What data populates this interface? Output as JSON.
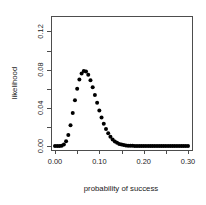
{
  "chart_data": {
    "type": "scatter",
    "title": "",
    "xlabel": "probability of success",
    "ylabel": "likelihood",
    "xlim": [
      0.0,
      0.3
    ],
    "ylim": [
      0.0,
      0.132
    ],
    "grid": false,
    "legend": null,
    "point_style": {
      "marker": "filled-circle",
      "color": "#000000",
      "size_px": 2.0
    },
    "xticks": [
      0.0,
      0.1,
      0.2,
      0.3
    ],
    "xtick_labels": [
      "0.00",
      "0.10",
      "0.20",
      "0.30"
    ],
    "x_minor_ticks": [
      0.05,
      0.15,
      0.25
    ],
    "yticks": [
      0.0,
      0.04,
      0.08,
      0.12
    ],
    "ytick_labels": [
      "0.00",
      "0.04",
      "0.08",
      "0.12"
    ],
    "y_minor_ticks": [
      0.02,
      0.06,
      0.1
    ],
    "x": [
      0.0,
      0.005,
      0.01,
      0.015,
      0.02,
      0.025,
      0.03,
      0.035,
      0.04,
      0.045,
      0.05,
      0.055,
      0.06,
      0.065,
      0.07,
      0.075,
      0.08,
      0.085,
      0.09,
      0.095,
      0.1,
      0.105,
      0.11,
      0.115,
      0.12,
      0.125,
      0.13,
      0.135,
      0.14,
      0.145,
      0.15,
      0.155,
      0.16,
      0.165,
      0.17,
      0.175,
      0.18,
      0.185,
      0.19,
      0.195,
      0.2,
      0.205,
      0.21,
      0.215,
      0.22,
      0.225,
      0.23,
      0.235,
      0.24,
      0.245,
      0.25,
      0.255,
      0.26,
      0.265,
      0.27,
      0.275,
      0.28,
      0.285,
      0.29,
      0.295,
      0.3
    ],
    "y": [
      0.0,
      0.0,
      2e-05,
      0.00026,
      0.00146,
      0.00486,
      0.01158,
      0.02182,
      0.03452,
      0.04786,
      0.06002,
      0.0696,
      0.07586,
      0.07861,
      0.07802,
      0.07455,
      0.06885,
      0.06161,
      0.05353,
      0.04522,
      0.03719,
      0.0298,
      0.02328,
      0.01775,
      0.01323,
      0.00965,
      0.00689,
      0.00481,
      0.0033,
      0.00222,
      0.00146,
      0.00095,
      0.0006,
      0.00038,
      0.00023,
      0.00014,
      8e-05,
      5e-05,
      3e-05,
      2e-05,
      1e-05,
      6e-06,
      3e-06,
      2e-06,
      1e-06,
      6e-07,
      3e-07,
      2e-07,
      1e-07,
      5e-08,
      2e-08,
      1e-08,
      6e-09,
      3e-09,
      1e-09,
      7e-10,
      3e-10,
      2e-10,
      8e-11,
      4e-11,
      2e-11
    ],
    "peak": {
      "x": 0.085,
      "y": 0.129
    },
    "note_distribution": "binomial likelihood, peak near p=0.085"
  },
  "plot_box": {
    "left": 51,
    "right": 192,
    "top": 16,
    "bottom": 150
  }
}
